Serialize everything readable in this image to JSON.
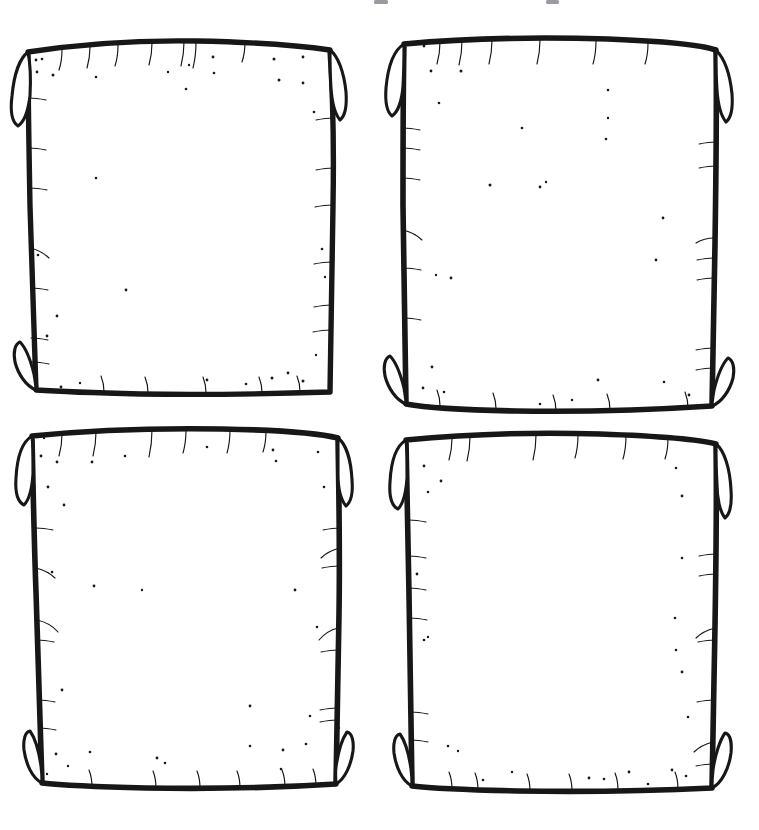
{
  "document": {
    "title": "Four Hand-Drawn Panel Frames",
    "kind": "blank-comic-storyboard-template",
    "background_color": "#ffffff",
    "ink_color": "#171717",
    "speckle_color": "#1a1a1a",
    "width": 759,
    "height": 830,
    "style": "hand-drawn ink outline, parchment scroll frames with curled corners"
  },
  "top_artifacts": {
    "description": "two faint cropped marks at the very top edge of the image",
    "marks": [
      {
        "name": "top-mark-left",
        "x": 374,
        "y": 0,
        "w": 14,
        "h": 4,
        "color": "#9a9aa2"
      },
      {
        "name": "top-mark-right",
        "x": 546,
        "y": 0,
        "w": 13,
        "h": 4,
        "color": "#9a9aa2"
      }
    ]
  },
  "grid": {
    "rows": 2,
    "columns": 2,
    "gap_x": 68,
    "gap_y": 33
  },
  "panels": [
    {
      "id": "panel-1",
      "position": "top-left",
      "row": 1,
      "column": 1,
      "label": "",
      "caption": "",
      "bounds": {
        "x": 18,
        "y": 42,
        "w": 318,
        "h": 355
      },
      "corner_curls": [
        "top-left",
        "top-right",
        "bottom-left"
      ],
      "content": "blank"
    },
    {
      "id": "panel-2",
      "position": "top-right",
      "row": 1,
      "column": 2,
      "label": "",
      "caption": "",
      "bounds": {
        "x": 396,
        "y": 35,
        "w": 328,
        "h": 378
      },
      "corner_curls": [
        "top-left",
        "top-right",
        "bottom-left",
        "bottom-right"
      ],
      "content": "blank"
    },
    {
      "id": "panel-3",
      "position": "bottom-left",
      "row": 2,
      "column": 1,
      "label": "",
      "caption": "",
      "bounds": {
        "x": 20,
        "y": 428,
        "w": 322,
        "h": 362
      },
      "corner_curls": [
        "top-left",
        "top-right",
        "bottom-left",
        "bottom-right"
      ],
      "content": "blank"
    },
    {
      "id": "panel-4",
      "position": "bottom-right",
      "row": 2,
      "column": 2,
      "label": "",
      "caption": "",
      "bounds": {
        "x": 396,
        "y": 432,
        "w": 328,
        "h": 360
      },
      "corner_curls": [
        "top-left",
        "top-right",
        "bottom-left",
        "bottom-right"
      ],
      "content": "blank"
    }
  ],
  "speckles": {
    "count_total": 96,
    "radius_range": [
      1.0,
      1.9
    ],
    "panel_1": [
      [
        36,
        60
      ],
      [
        42,
        59
      ],
      [
        37,
        72
      ],
      [
        53,
        75
      ],
      [
        96,
        178
      ],
      [
        126,
        290
      ],
      [
        168,
        72
      ],
      [
        189,
        65
      ],
      [
        96,
        77
      ],
      [
        186,
        89
      ],
      [
        213,
        57
      ],
      [
        214,
        73
      ],
      [
        274,
        59
      ],
      [
        303,
        57
      ],
      [
        279,
        80
      ],
      [
        303,
        83
      ],
      [
        314,
        112
      ],
      [
        322,
        249
      ],
      [
        325,
        277
      ],
      [
        57,
        316
      ],
      [
        38,
        255
      ],
      [
        47,
        336
      ],
      [
        128,
        292
      ],
      [
        207,
        380
      ],
      [
        272,
        378
      ],
      [
        288,
        373
      ],
      [
        303,
        381
      ],
      [
        316,
        355
      ],
      [
        246,
        384
      ],
      [
        37,
        386
      ],
      [
        61,
        387
      ],
      [
        80,
        383
      ]
    ],
    "panel_2": [
      [
        412,
        44
      ],
      [
        424,
        46
      ],
      [
        431,
        71
      ],
      [
        461,
        71
      ],
      [
        439,
        103
      ],
      [
        608,
        90
      ],
      [
        608,
        118
      ],
      [
        606,
        139
      ],
      [
        522,
        128
      ],
      [
        540,
        187
      ],
      [
        663,
        218
      ],
      [
        451,
        278
      ],
      [
        656,
        260
      ],
      [
        436,
        275
      ],
      [
        546,
        182
      ],
      [
        432,
        367
      ],
      [
        423,
        388
      ],
      [
        444,
        392
      ],
      [
        598,
        380
      ],
      [
        664,
        382
      ],
      [
        689,
        395
      ],
      [
        712,
        392
      ],
      [
        540,
        404
      ],
      [
        572,
        400
      ],
      [
        490,
        185
      ]
    ],
    "panel_3": [
      [
        40,
        436
      ],
      [
        44,
        438
      ],
      [
        41,
        456
      ],
      [
        57,
        462
      ],
      [
        92,
        462
      ],
      [
        125,
        456
      ],
      [
        207,
        447
      ],
      [
        273,
        450
      ],
      [
        276,
        461
      ],
      [
        318,
        452
      ],
      [
        324,
        487
      ],
      [
        48,
        487
      ],
      [
        64,
        505
      ],
      [
        52,
        572
      ],
      [
        94,
        586
      ],
      [
        142,
        590
      ],
      [
        295,
        590
      ],
      [
        317,
        627
      ],
      [
        62,
        690
      ],
      [
        250,
        706
      ],
      [
        310,
        716
      ],
      [
        41,
        744
      ],
      [
        56,
        754
      ],
      [
        90,
        752
      ],
      [
        157,
        758
      ],
      [
        165,
        763
      ],
      [
        250,
        746
      ],
      [
        283,
        750
      ],
      [
        306,
        744
      ],
      [
        47,
        774
      ],
      [
        68,
        766
      ],
      [
        281,
        769
      ],
      [
        339,
        728
      ]
    ],
    "panel_4": [
      [
        424,
        466
      ],
      [
        441,
        481
      ],
      [
        428,
        492
      ],
      [
        676,
        468
      ],
      [
        682,
        496
      ],
      [
        682,
        558
      ],
      [
        675,
        618
      ],
      [
        417,
        574
      ],
      [
        424,
        640
      ],
      [
        428,
        637
      ],
      [
        676,
        650
      ],
      [
        682,
        672
      ],
      [
        448,
        746
      ],
      [
        458,
        751
      ],
      [
        483,
        780
      ],
      [
        589,
        778
      ],
      [
        604,
        779
      ],
      [
        629,
        772
      ],
      [
        672,
        770
      ],
      [
        686,
        776
      ],
      [
        648,
        784
      ],
      [
        512,
        772
      ],
      [
        688,
        717
      ]
    ]
  },
  "edge_ticks": {
    "description": "short hair-like strokes hanging from the ink borders, hand-drawn texture",
    "panel_1": {
      "top": [
        62,
        90,
        118,
        152,
        184,
        196,
        245
      ],
      "left": [
        98,
        148,
        188,
        248,
        288,
        338,
        362
      ],
      "right": [
        118,
        168,
        205,
        262,
        305,
        330
      ],
      "bottom": [
        104,
        148,
        206,
        262,
        300
      ]
    },
    "panel_2": {
      "top": [
        440,
        462,
        492,
        540,
        596,
        648
      ],
      "left": [
        128,
        148,
        178,
        230,
        268,
        318
      ],
      "right": [
        142,
        166,
        238,
        258,
        278,
        348,
        368
      ],
      "bottom": [
        440,
        496,
        556,
        610,
        688
      ]
    },
    "panel_3": {
      "top": [
        62,
        96,
        152,
        186,
        230,
        266
      ],
      "left": [
        528,
        568,
        620,
        640,
        700,
        728
      ],
      "right": [
        528,
        548,
        566,
        628,
        650,
        708,
        720
      ],
      "bottom": [
        92,
        156,
        200,
        240,
        285,
        316
      ]
    },
    "panel_4": {
      "top": [
        452,
        470,
        536,
        578,
        626,
        668
      ],
      "left": [
        520,
        556,
        588,
        618,
        712,
        740
      ],
      "right": [
        554,
        574,
        628,
        640,
        700,
        742,
        764
      ],
      "bottom": [
        452,
        478,
        530,
        572,
        618,
        678
      ]
    }
  }
}
